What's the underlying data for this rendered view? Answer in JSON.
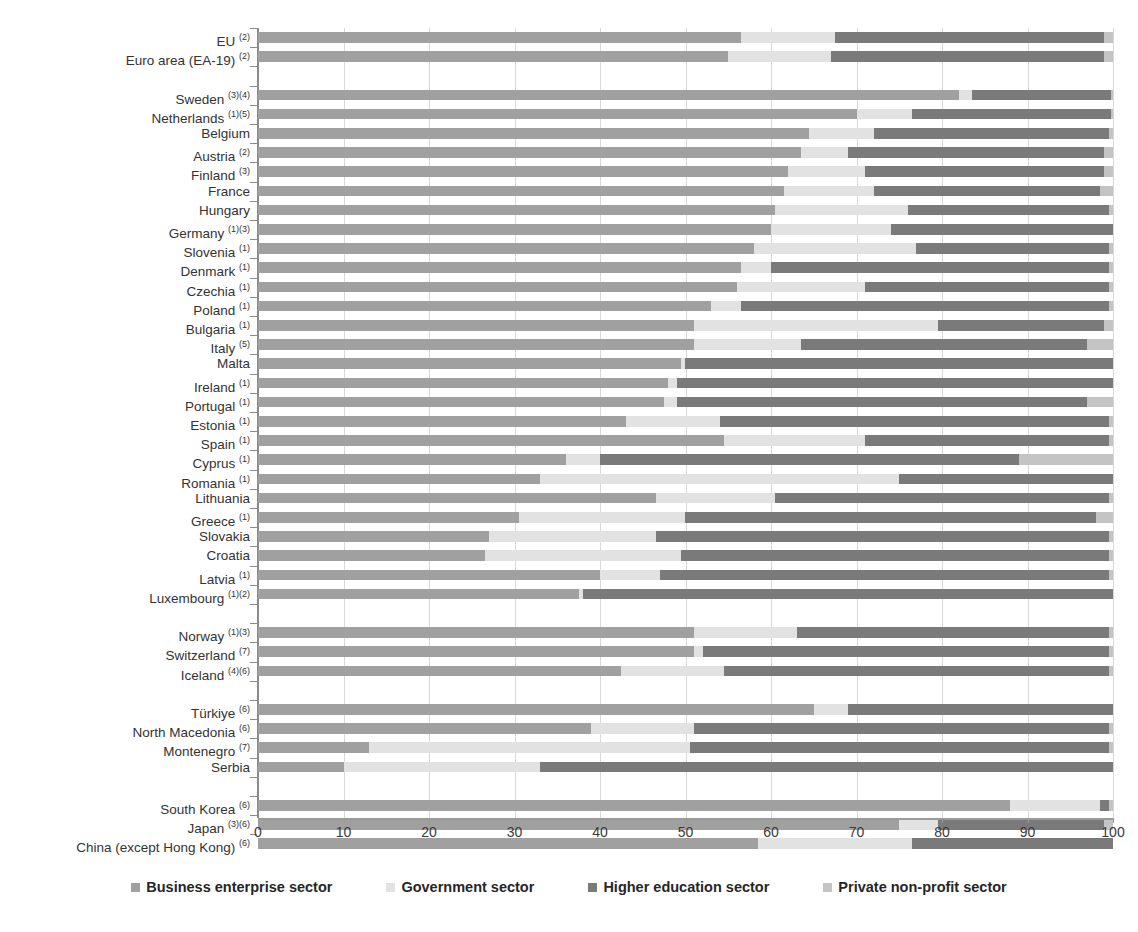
{
  "chart_data": {
    "type": "bar",
    "orientation": "horizontal",
    "stacked": true,
    "stack_mode": "percent",
    "title": "",
    "subtitle": "",
    "xlabel": "",
    "ylabel": "",
    "xlim": [
      0,
      100
    ],
    "xticks": [
      "0",
      "10",
      "20",
      "30",
      "40",
      "50",
      "60",
      "70",
      "80",
      "90",
      "100"
    ],
    "grid": true,
    "legend_position": "bottom",
    "series": [
      {
        "name": "Business enterprise sector",
        "color": "#a0a0a0"
      },
      {
        "name": "Government sector",
        "color": "#e2e2e2"
      },
      {
        "name": "Higher education sector",
        "color": "#7a7a7a"
      },
      {
        "name": "Private non-profit sector",
        "color": "#c4c4c4"
      }
    ],
    "categories": [
      "EU (2)",
      "Euro area (EA-19) (2)",
      "",
      "Sweden (3)(4)",
      "Netherlands (1)(5)",
      "Belgium",
      "Austria (2)",
      "Finland (3)",
      "France",
      "Hungary",
      "Germany (1)(3)",
      "Slovenia (1)",
      "Denmark (1)",
      "Czechia (1)",
      "Poland (1)",
      "Bulgaria (1)",
      "Italy (5)",
      "Malta",
      "Ireland (1)",
      "Portugal (1)",
      "Estonia (1)",
      "Spain (1)",
      "Cyprus (1)",
      "Romania (1)",
      "Lithuania",
      "Greece (1)",
      "Slovakia",
      "Croatia",
      "Latvia (1)",
      "Luxembourg (1)(2)",
      "",
      "Norway (1)(3)",
      "Switzerland (7)",
      "Iceland (4)(6)",
      "",
      "Türkiye (6)",
      "North Macedonia (6)",
      "Montenegro (7)",
      "Serbia",
      "",
      "South Korea (6)",
      "Japan (3)(6)",
      "China (except Hong Kong) (6)"
    ],
    "rows": [
      {
        "label": "EU",
        "sup": "(2)",
        "values": [
          56.5,
          11.0,
          31.5,
          1.0
        ]
      },
      {
        "label": "Euro area (EA-19)",
        "sup": "(2)",
        "values": [
          55.0,
          12.0,
          32.0,
          1.0
        ]
      },
      {
        "label": "",
        "sup": "",
        "values": null
      },
      {
        "label": "Sweden",
        "sup": "(3)(4)",
        "values": [
          82.0,
          1.5,
          16.3,
          0.2
        ]
      },
      {
        "label": "Netherlands",
        "sup": "(1)(5)",
        "values": [
          70.0,
          6.5,
          23.3,
          0.2
        ]
      },
      {
        "label": "Belgium",
        "sup": "",
        "values": [
          64.5,
          7.5,
          27.5,
          0.5
        ]
      },
      {
        "label": "Austria",
        "sup": "(2)",
        "values": [
          63.5,
          5.5,
          30.0,
          1.0
        ]
      },
      {
        "label": "Finland",
        "sup": "(3)",
        "values": [
          62.0,
          9.0,
          28.0,
          1.0
        ]
      },
      {
        "label": "France",
        "sup": "",
        "values": [
          61.5,
          10.5,
          26.5,
          1.5
        ]
      },
      {
        "label": "Hungary",
        "sup": "",
        "values": [
          60.5,
          15.5,
          23.5,
          0.5
        ]
      },
      {
        "label": "Germany",
        "sup": "(1)(3)",
        "values": [
          60.0,
          14.0,
          26.0,
          0.0
        ]
      },
      {
        "label": "Slovenia",
        "sup": "(1)",
        "values": [
          58.0,
          19.0,
          22.5,
          0.5
        ]
      },
      {
        "label": "Denmark",
        "sup": "(1)",
        "values": [
          56.5,
          3.5,
          39.5,
          0.5
        ]
      },
      {
        "label": "Czechia",
        "sup": "(1)",
        "values": [
          56.0,
          15.0,
          28.5,
          0.5
        ]
      },
      {
        "label": "Poland",
        "sup": "(1)",
        "values": [
          53.0,
          3.5,
          43.0,
          0.5
        ]
      },
      {
        "label": "Bulgaria",
        "sup": "(1)",
        "values": [
          51.0,
          28.5,
          19.5,
          1.0
        ]
      },
      {
        "label": "Italy",
        "sup": "(5)",
        "values": [
          51.0,
          12.5,
          33.5,
          3.0
        ]
      },
      {
        "label": "Malta",
        "sup": "",
        "values": [
          49.5,
          0.5,
          50.0,
          0.0
        ]
      },
      {
        "label": "Ireland",
        "sup": "(1)",
        "values": [
          48.0,
          1.0,
          51.0,
          0.0
        ]
      },
      {
        "label": "Portugal",
        "sup": "(1)",
        "values": [
          47.5,
          1.5,
          48.0,
          3.0
        ]
      },
      {
        "label": "Estonia",
        "sup": "(1)",
        "values": [
          43.0,
          11.0,
          45.5,
          0.5
        ]
      },
      {
        "label": "Spain",
        "sup": "(1)",
        "values": [
          54.5,
          16.5,
          28.5,
          0.5
        ]
      },
      {
        "label": "Cyprus",
        "sup": "(1)",
        "values": [
          36.0,
          4.0,
          49.0,
          11.0
        ]
      },
      {
        "label": "Romania",
        "sup": "(1)",
        "values": [
          33.0,
          42.0,
          25.0,
          0.0
        ]
      },
      {
        "label": "Lithuania",
        "sup": "",
        "values": [
          46.5,
          14.0,
          39.0,
          0.5
        ]
      },
      {
        "label": "Greece",
        "sup": "(1)",
        "values": [
          30.5,
          19.5,
          48.0,
          2.0
        ]
      },
      {
        "label": "Slovakia",
        "sup": "",
        "values": [
          27.0,
          19.5,
          53.0,
          0.5
        ]
      },
      {
        "label": "Croatia",
        "sup": "",
        "values": [
          26.5,
          23.0,
          50.0,
          0.5
        ]
      },
      {
        "label": "Latvia",
        "sup": "(1)",
        "values": [
          40.0,
          7.0,
          52.5,
          0.5
        ]
      },
      {
        "label": "Luxembourg",
        "sup": "(1)(2)",
        "values": [
          37.5,
          0.5,
          62.0,
          0.0
        ]
      },
      {
        "label": "",
        "sup": "",
        "values": null
      },
      {
        "label": "Norway",
        "sup": "(1)(3)",
        "values": [
          51.0,
          12.0,
          36.5,
          0.5
        ]
      },
      {
        "label": "Switzerland",
        "sup": "(7)",
        "values": [
          51.0,
          1.0,
          47.5,
          0.5
        ]
      },
      {
        "label": "Iceland",
        "sup": "(4)(6)",
        "values": [
          42.5,
          12.0,
          45.0,
          0.5
        ]
      },
      {
        "label": "",
        "sup": "",
        "values": null
      },
      {
        "label": "Türkiye",
        "sup": "(6)",
        "values": [
          65.0,
          4.0,
          31.0,
          0.0
        ]
      },
      {
        "label": "North Macedonia",
        "sup": "(6)",
        "values": [
          39.0,
          12.0,
          48.5,
          0.5
        ]
      },
      {
        "label": "Montenegro",
        "sup": "(7)",
        "values": [
          13.0,
          37.5,
          49.0,
          0.5
        ]
      },
      {
        "label": "Serbia",
        "sup": "",
        "values": [
          10.0,
          23.0,
          67.0,
          0.0
        ]
      },
      {
        "label": "",
        "sup": "",
        "values": null
      },
      {
        "label": "South Korea",
        "sup": "(6)",
        "values": [
          88.0,
          10.5,
          1.0,
          0.5
        ]
      },
      {
        "label": "Japan",
        "sup": "(3)(6)",
        "values": [
          75.0,
          4.5,
          19.5,
          1.0
        ]
      },
      {
        "label": "China (except Hong Kong)",
        "sup": "(6)",
        "values": [
          58.5,
          18.0,
          23.5,
          0.0
        ]
      }
    ]
  },
  "legend": {
    "items": [
      {
        "label": "Business enterprise sector",
        "swatch": "s0"
      },
      {
        "label": "Government sector",
        "swatch": "s1"
      },
      {
        "label": "Higher education sector",
        "swatch": "s2"
      },
      {
        "label": "Private non-profit sector",
        "swatch": "s3"
      }
    ]
  },
  "axis": {
    "x_ticks": [
      "0",
      "10",
      "20",
      "30",
      "40",
      "50",
      "60",
      "70",
      "80",
      "90",
      "100"
    ]
  }
}
